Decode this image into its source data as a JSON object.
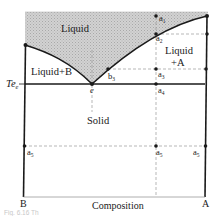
{
  "figure": {
    "caption": "Fig. 6.16  Th",
    "x_axis_label": "Composition",
    "left_component": "B",
    "right_component": "A",
    "eutectic_temperature_label": "Te",
    "eutectic_temperature_sub": "e"
  },
  "regions": {
    "liquid": "Liquid",
    "liquid_plus_a_line1": "Liquid",
    "liquid_plus_a_line2": "+A",
    "liquid_plus_b": "Liquid+B",
    "solid": "Solid"
  },
  "points": {
    "eutectic": "e",
    "b3": "b",
    "b3_sub": "3",
    "a1": "a",
    "a1_sub": "1",
    "a2": "a",
    "a2_sub": "2",
    "a3": "a",
    "a3_sub": "3",
    "a4": "a",
    "a4_sub": "4",
    "a5": "a",
    "a5_sub": "5",
    "a5_prime": "a",
    "a5_prime_sub": "5",
    "a5_double_prime": "a",
    "a5_double_prime_sub": "5"
  },
  "colors": {
    "line": "#1a1a1a",
    "dashed": "#9a9a9a",
    "liquid_fill": "#c9c9c9",
    "background": "#ffffff"
  }
}
